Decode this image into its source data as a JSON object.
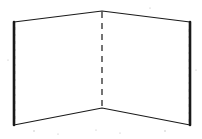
{
  "figure": {
    "name": "folded-panel-line-drawing",
    "canvas": {
      "width": 202,
      "height": 139
    },
    "background_color": "#ffffff",
    "ink_color": "#1a1a1a",
    "fold_line_color": "#2a2a2a",
    "speck_color": "#b9b9b9",
    "style": "hand-drawn scanned line art, no shading, no labels",
    "text_labels": [],
    "geometry": {
      "top_left": {
        "x": 14,
        "y": 22
      },
      "top_center": {
        "x": 102,
        "y": 11
      },
      "top_right": {
        "x": 190,
        "y": 22
      },
      "bottom_left": {
        "x": 14,
        "y": 125
      },
      "bottom_center": {
        "x": 102,
        "y": 108
      },
      "bottom_right": {
        "x": 190,
        "y": 125
      },
      "fold_axis_x": 102,
      "fold_top_y": 13,
      "fold_bottom_y": 107
    },
    "paths": {
      "left_panel_face": "M 14,22 L 102,11 L 102,108 L 14,125 Z",
      "right_panel_face": "M 102,11 L 190,22 L 190,125 L 102,108 Z",
      "top_edge": "M 14,22 L 102,11 L 190,22",
      "bottom_edge": "M 14,125 L 102,108 L 190,125",
      "left_edge": "M 14,22 L 14,125",
      "right_edge": "M 190,22 L 190,125",
      "fold_line": "M 102,12 L 102,107"
    },
    "fold_dash_pattern": "6 5",
    "edges": [
      {
        "id": "top-left-edge",
        "weight": "thin"
      },
      {
        "id": "top-right-edge",
        "weight": "thin"
      },
      {
        "id": "bottom-left-edge",
        "weight": "thin"
      },
      {
        "id": "bottom-right-edge",
        "weight": "thin"
      },
      {
        "id": "left-vertical-edge",
        "weight": "thick"
      },
      {
        "id": "right-vertical-edge",
        "weight": "thick"
      },
      {
        "id": "center-fold",
        "weight": "dashed"
      }
    ]
  }
}
